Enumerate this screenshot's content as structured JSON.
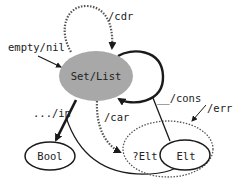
{
  "diagram": {
    "type": "state-machine",
    "colors": {
      "main_node_fill": "#a8a8a8",
      "stroke": "#1a1a1a",
      "dotted_stroke": "#555555",
      "background": "#ffffff"
    },
    "nodes": {
      "set_list": {
        "label": "Set/List",
        "fill": "gray"
      },
      "bool": {
        "label": "Bool"
      },
      "maybe_elt": {
        "label": "?Elt",
        "style": "dotted"
      },
      "elt": {
        "label": "Elt"
      }
    },
    "edges": {
      "empty_nil": {
        "label": "empty/nil",
        "from": "start",
        "to": "Set/List"
      },
      "cdr": {
        "label": "/cdr",
        "from": "Set/List",
        "to": "Set/List",
        "style": "dotted"
      },
      "cons": {
        "label": "__/cons",
        "from": "Elt",
        "to": "Set/List",
        "style": "thick"
      },
      "in": {
        "label": ".../in",
        "from": "Set/List",
        "to": "Bool",
        "style": "thick"
      },
      "car": {
        "label": "/car",
        "from": "Set/List",
        "to": "?Elt",
        "style": "dotted"
      },
      "err": {
        "label": "/err",
        "to": "?Elt",
        "style": "thin"
      }
    }
  }
}
